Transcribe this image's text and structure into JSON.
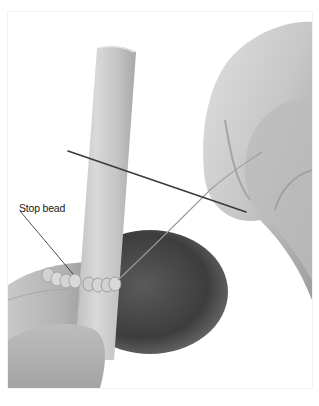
{
  "figure": {
    "labels": [
      {
        "text": "Stop bead",
        "target": "stop-bead"
      }
    ]
  },
  "colors": {
    "page_background": "#ffffff",
    "photo_background": "#ffffff",
    "skin_light": "#d6d6d6",
    "skin_mid": "#b8b8b8",
    "skin_dark": "#4a4a4a",
    "tube": "#c9c9c9",
    "needle": "#3a3a3a",
    "thread": "#9a9a9a",
    "beads": "#d0d0d0",
    "label_text": "#1a1a1a",
    "leader_line": "#222222"
  }
}
